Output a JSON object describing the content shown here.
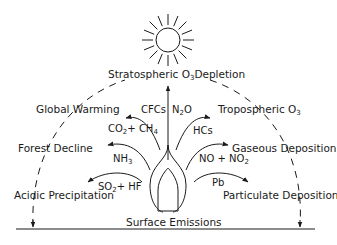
{
  "diagram": {
    "center": {
      "label": "Surface Emissions"
    },
    "top": {
      "label_pre": "Stratospheric O",
      "label_sub": "3",
      "label_post": "Depletion"
    },
    "effects": [
      {
        "id": "global-warming",
        "label": "Global Warming"
      },
      {
        "id": "forest-decline",
        "label": "Forest Decline"
      },
      {
        "id": "acidic-precipitation",
        "label": "Acidic Precipitation"
      },
      {
        "id": "tropospheric-o3",
        "label_pre": "Tropospheric O",
        "label_sub": "3"
      },
      {
        "id": "gaseous-deposition",
        "label": "Gaseous Deposition"
      },
      {
        "id": "particulate-deposition",
        "label": "Particulate Deposition"
      }
    ],
    "pollutants": {
      "cfcs": "CFCs",
      "n2o": {
        "pre": "N",
        "sub": "2",
        "post": "O"
      },
      "co2_ch4": {
        "a": "CO",
        "a_sub": "2",
        "mid": "+ CH",
        "b_sub": "4"
      },
      "hcs": "HCs",
      "nh3": {
        "pre": "NH",
        "sub": "3"
      },
      "no_no2": {
        "pre": "NO + NO",
        "sub": "2"
      },
      "so2_hf": {
        "pre": "SO",
        "sub": "2",
        "post": "+ HF"
      },
      "pb": "Pb"
    },
    "icons": {
      "sun": "sun-icon",
      "flame": "flame-icon"
    }
  }
}
